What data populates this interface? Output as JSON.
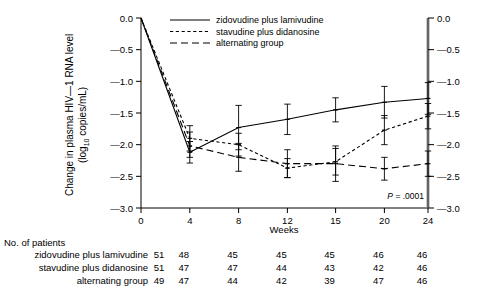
{
  "chart_data": {
    "type": "line",
    "title": "",
    "xlabel": "Weeks",
    "ylabel_line1": "Change in plasma HIV—1 RNA level",
    "ylabel_line2_pre": "(log",
    "ylabel_line2_sub": "10",
    "ylabel_line2_post": " copies/mL)",
    "x": [
      0,
      4,
      8,
      12,
      15,
      20,
      24
    ],
    "xticklabels": [
      "0",
      "4",
      "8",
      "12",
      "15",
      "20",
      "24"
    ],
    "ylim": [
      -3.0,
      0.0
    ],
    "yticks": [
      0.0,
      -0.5,
      -1.0,
      -1.5,
      -2.0,
      -2.5,
      -3.0
    ],
    "yticklabels": [
      "0.0",
      "—0.5",
      "—1.0",
      "—1.5",
      "—2.0",
      "—2.5",
      "—3.0"
    ],
    "yticklabels_right": [
      "0.0",
      "—0.5",
      "—1.0",
      "—1.5",
      "—2.0",
      "—2.5",
      "—3.0"
    ],
    "grid": false,
    "legend_position": "top-center",
    "annotation": "P = .0001",
    "annotation_italic_part": "P",
    "annotation_rest": " = .0001",
    "series": [
      {
        "name": "zidovudine plus lamivudine",
        "style": "solid",
        "values": [
          0.0,
          -2.12,
          -1.73,
          -1.6,
          -1.45,
          -1.33,
          -1.27
        ],
        "err_low": [
          0.0,
          -2.29,
          -2.08,
          -1.84,
          -1.64,
          -1.58,
          -1.52
        ],
        "err_high": [
          0.0,
          -1.95,
          -1.38,
          -1.36,
          -1.26,
          -1.08,
          -1.02
        ]
      },
      {
        "name": "stavudine plus didanosine",
        "style": "short-dash",
        "values": [
          0.0,
          -1.9,
          -2.0,
          -2.37,
          -2.27,
          -1.77,
          -1.55
        ],
        "err_low": [
          0.0,
          -2.1,
          -2.18,
          -2.52,
          -2.48,
          -2.0,
          -1.75
        ],
        "err_high": [
          0.0,
          -1.7,
          -1.82,
          -2.22,
          -2.06,
          -1.54,
          -1.35
        ]
      },
      {
        "name": "alternating group",
        "style": "long-dash",
        "values": [
          0.0,
          -2.02,
          -2.2,
          -2.3,
          -2.3,
          -2.38,
          -2.3
        ],
        "err_low": [
          0.0,
          -2.2,
          -2.42,
          -2.52,
          -2.58,
          -2.56,
          -2.5
        ],
        "err_high": [
          0.0,
          -1.8,
          -1.98,
          -2.08,
          -2.02,
          -2.2,
          -2.1
        ]
      }
    ]
  },
  "legend": {
    "items": [
      {
        "label": "zidovudine plus lamivudine",
        "style": "solid"
      },
      {
        "label": "stavudine plus didanosine",
        "style": "short-dash"
      },
      {
        "label": "alternating group",
        "style": "long-dash"
      }
    ]
  },
  "patients_table": {
    "title": "No. of patients",
    "rows": [
      {
        "label": "zidovudine plus lamivudine",
        "values": [
          "51",
          "48",
          "45",
          "45",
          "45",
          "46",
          "46"
        ]
      },
      {
        "label": "stavudine plus didanosine",
        "values": [
          "51",
          "47",
          "47",
          "44",
          "43",
          "42",
          "46"
        ]
      },
      {
        "label": "alternating group",
        "values": [
          "49",
          "47",
          "44",
          "42",
          "39",
          "47",
          "46"
        ]
      }
    ]
  },
  "colors": {
    "line": "#000000",
    "axis": "#000000",
    "text": "#000000",
    "background": "#ffffff",
    "right_spine": "#9a9a9a"
  }
}
